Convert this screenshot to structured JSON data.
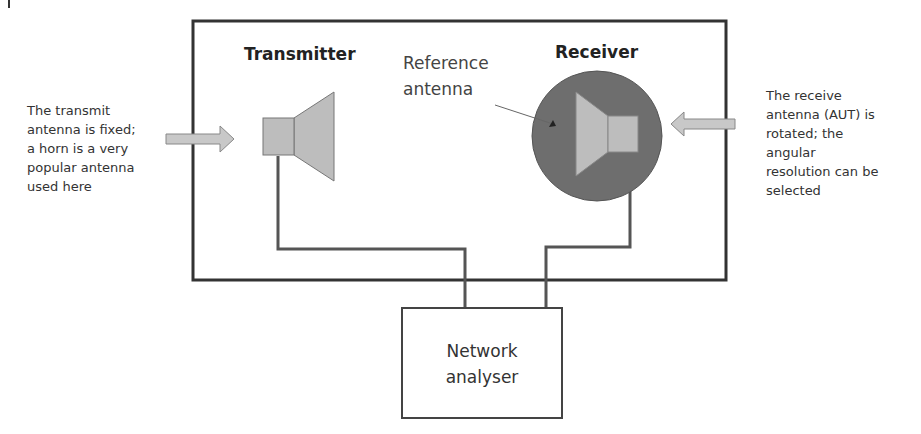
{
  "diagram": {
    "type": "antenna-measurement-setup",
    "labels": {
      "transmitter": "Transmitter",
      "receiver": "Receiver",
      "reference_antenna": [
        "Reference",
        "antenna"
      ],
      "network_analyser": [
        "Network",
        "analyser"
      ]
    },
    "annotations": {
      "left": [
        "The transmit",
        "antenna is fixed;",
        "a horn is a very",
        "popular antenna",
        "used here"
      ],
      "right": [
        "The receive",
        "antenna (AUT) is",
        "rotated; the",
        "angular",
        "resolution can be",
        "selected"
      ]
    },
    "colors": {
      "frame": "#333333",
      "horn_fill": "#bdbdbd",
      "rotator_fill": "#6e6e6e",
      "arrow_fill": "#c8c8c8",
      "cable": "#555555"
    }
  }
}
